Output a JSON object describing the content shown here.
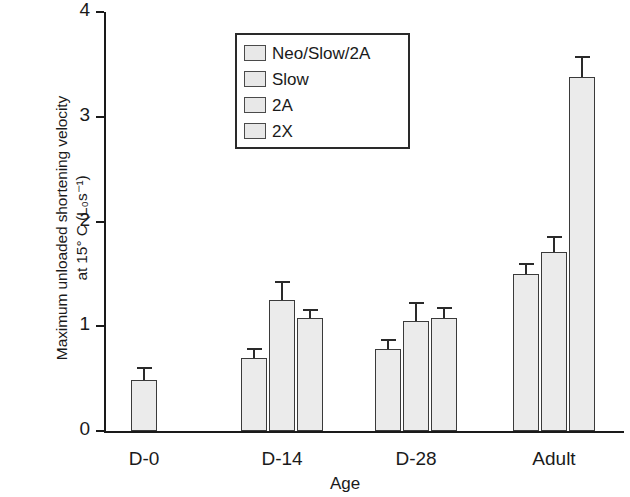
{
  "chart_data": {
    "type": "bar",
    "title": "",
    "xlabel": "Age",
    "ylabel_line1": "Maximum unloaded shortening velocity",
    "ylabel_line2": "at 15° C (L₀s⁻¹)",
    "categories": [
      "D-0",
      "D-14",
      "D-28",
      "Adult"
    ],
    "ylim": [
      0,
      4
    ],
    "yticks": [
      0,
      1,
      2,
      3,
      4
    ],
    "ytick_labels": [
      "0",
      "1",
      "2",
      "3",
      "4"
    ],
    "grid": false,
    "legend_position": "upper left inside plot",
    "series": [
      {
        "name": "Neo/Slow/2A",
        "values": [
          0.49,
          0.7,
          0.78,
          1.5
        ],
        "errors": [
          0.12,
          0.09,
          0.1,
          0.1
        ]
      },
      {
        "name": "Slow",
        "values": [
          null,
          1.25,
          1.05,
          1.71
        ],
        "errors": [
          null,
          0.18,
          0.18,
          0.15
        ]
      },
      {
        "name": "2A",
        "values": [
          null,
          1.08,
          1.08,
          3.38
        ],
        "errors": [
          null,
          0.08,
          0.1,
          0.2
        ]
      },
      {
        "name": "2X",
        "values": [
          null,
          null,
          null,
          null
        ],
        "errors": [
          null,
          null,
          null,
          null
        ]
      }
    ],
    "colors": {
      "bar_fill": "#ebebeb",
      "bar_outline": "#3a3a3a",
      "axis": "#1a1a1a",
      "error_bar": "#2a2a2a"
    }
  },
  "legend": {
    "items": [
      {
        "label": "Neo/Slow/2A",
        "swatch": "#e8e8e8"
      },
      {
        "label": "Slow",
        "swatch": "#e8e8e8"
      },
      {
        "label": "2A",
        "swatch": "#e8e8e8"
      },
      {
        "label": "2X",
        "swatch": "#e8e8e8"
      }
    ]
  }
}
